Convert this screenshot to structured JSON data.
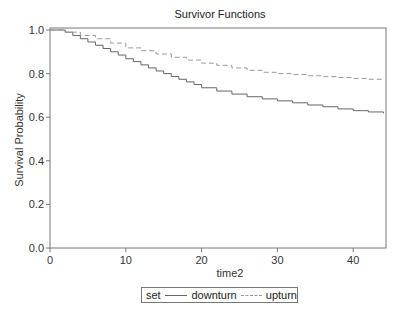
{
  "chart_data": {
    "type": "line",
    "title": "Survivor Functions",
    "xlabel": "time2",
    "ylabel": "Survival Probability",
    "xlim": [
      0,
      44.3
    ],
    "ylim": [
      0,
      1.0
    ],
    "x_ticks": [
      0,
      10,
      20,
      30,
      40
    ],
    "y_ticks": [
      "0.0",
      "0.2",
      "0.4",
      "0.6",
      "0.8",
      "1.0"
    ],
    "grid": false,
    "legend_position": "bottom",
    "legend_title": "set",
    "series": [
      {
        "name": "downturn",
        "style": "solid-step",
        "color": "#666666",
        "x": [
          0,
          2,
          3,
          4,
          5,
          6,
          7,
          8,
          9,
          10,
          11,
          12,
          13,
          14,
          15,
          16,
          17,
          18,
          19,
          20,
          22,
          24,
          26,
          28,
          30,
          32,
          34,
          36,
          38,
          40,
          42,
          44
        ],
        "y": [
          1.0,
          0.99,
          0.975,
          0.96,
          0.945,
          0.93,
          0.915,
          0.9,
          0.885,
          0.868,
          0.855,
          0.84,
          0.826,
          0.812,
          0.8,
          0.787,
          0.774,
          0.762,
          0.75,
          0.735,
          0.72,
          0.706,
          0.694,
          0.684,
          0.675,
          0.666,
          0.656,
          0.648,
          0.638,
          0.63,
          0.624,
          0.618
        ]
      },
      {
        "name": "upturn",
        "style": "dashed-step",
        "color": "#999999",
        "x": [
          0,
          2,
          4,
          6,
          8,
          10,
          12,
          14,
          16,
          18,
          20,
          22,
          24,
          26,
          28,
          30,
          32,
          34,
          36,
          38,
          40,
          42,
          44
        ],
        "y": [
          1.0,
          0.99,
          0.975,
          0.96,
          0.94,
          0.918,
          0.905,
          0.89,
          0.875,
          0.862,
          0.848,
          0.838,
          0.826,
          0.815,
          0.806,
          0.8,
          0.796,
          0.79,
          0.786,
          0.782,
          0.778,
          0.774,
          0.77
        ]
      }
    ]
  }
}
